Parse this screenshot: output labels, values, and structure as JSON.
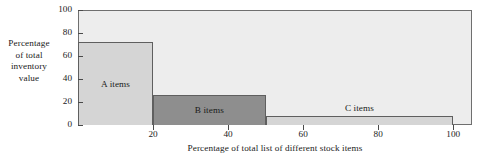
{
  "chart_data": {
    "type": "bar",
    "title": "",
    "xlabel": "Percentage of total list of different stock items",
    "ylabel_lines": [
      "Percentage",
      "of total",
      "inventory",
      "value"
    ],
    "ylabel": "Percentage of total inventory value",
    "xlim": [
      0,
      105
    ],
    "ylim": [
      0,
      100
    ],
    "grid": false,
    "legend": "none",
    "xticks": [
      20,
      40,
      60,
      80,
      100
    ],
    "xtick_labels": [
      "20",
      "40",
      "60",
      "80",
      "100"
    ],
    "yticks": [
      0,
      20,
      40,
      60,
      80,
      100
    ],
    "ytick_labels": [
      "0",
      "20",
      "40",
      "60",
      "80",
      "100"
    ],
    "categories": [
      "A items",
      "B items",
      "C items"
    ],
    "values": [
      72,
      26,
      7.5
    ],
    "bars": [
      {
        "label": "A items",
        "x_start": 0,
        "x_end": 20,
        "value": 72,
        "color": "#d5d5d5",
        "edge_color": "#5f5f5f"
      },
      {
        "label": "B items",
        "x_start": 20,
        "x_end": 50,
        "value": 26,
        "color": "#8e8e8e",
        "edge_color": "#5f5f5f"
      },
      {
        "label": "C items",
        "x_start": 50,
        "x_end": 100,
        "value": 7.5,
        "color": "#d5d5d5",
        "edge_color": "#5f5f5f"
      }
    ],
    "plot_background": "#ededed",
    "axis_color": "#6f6f6f",
    "page_background": "#ffffff"
  }
}
